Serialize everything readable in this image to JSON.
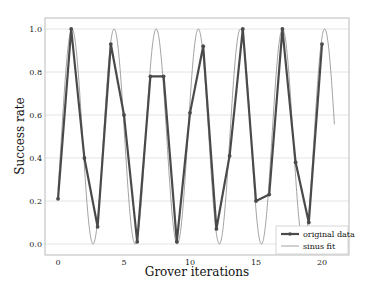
{
  "chart_data": {
    "type": "line",
    "title": "",
    "xlabel": "Grover iterations",
    "ylabel": "Success rate",
    "xlim": [
      -1.0,
      21.9
    ],
    "ylim": [
      -0.04,
      1.05
    ],
    "xticks": [
      0,
      5,
      10,
      15,
      20
    ],
    "yticks": [
      0.0,
      0.2,
      0.4,
      0.6,
      0.8,
      1.0
    ],
    "xtick_labels": [
      "0",
      "5",
      "10",
      "15",
      "20"
    ],
    "ytick_labels": [
      "0.0",
      "0.2",
      "0.4",
      "0.6",
      "0.8",
      "1.0"
    ],
    "grid": "horizontal",
    "legend_position": "lower right",
    "x": [
      0,
      1,
      2,
      3,
      4,
      5,
      6,
      7,
      8,
      9,
      10,
      11,
      12,
      13,
      14,
      15,
      16,
      17,
      18,
      19,
      20
    ],
    "series": [
      {
        "name": "original data",
        "style": "line+markers",
        "color": "#4a4a4a",
        "values": [
          0.21,
          1.0,
          0.4,
          0.08,
          0.93,
          0.6,
          0.01,
          0.78,
          0.78,
          0.01,
          0.61,
          0.92,
          0.07,
          0.41,
          1.0,
          0.2,
          0.23,
          1.0,
          0.38,
          0.1,
          0.93
        ]
      },
      {
        "name": "sinus fit",
        "style": "line",
        "color": "#8a8a8a",
        "function": "0.5 - 0.5*cos(2*pi*(x - 1.06)/3.19 + pi) ... i.e. peaks near x=1.06 with period 3.19",
        "period": 3.19,
        "peak_x": 1.06,
        "x_range": [
          0,
          20.95
        ]
      }
    ]
  },
  "legend": {
    "items": [
      {
        "label": "original data"
      },
      {
        "label": "sinus fit"
      }
    ]
  }
}
